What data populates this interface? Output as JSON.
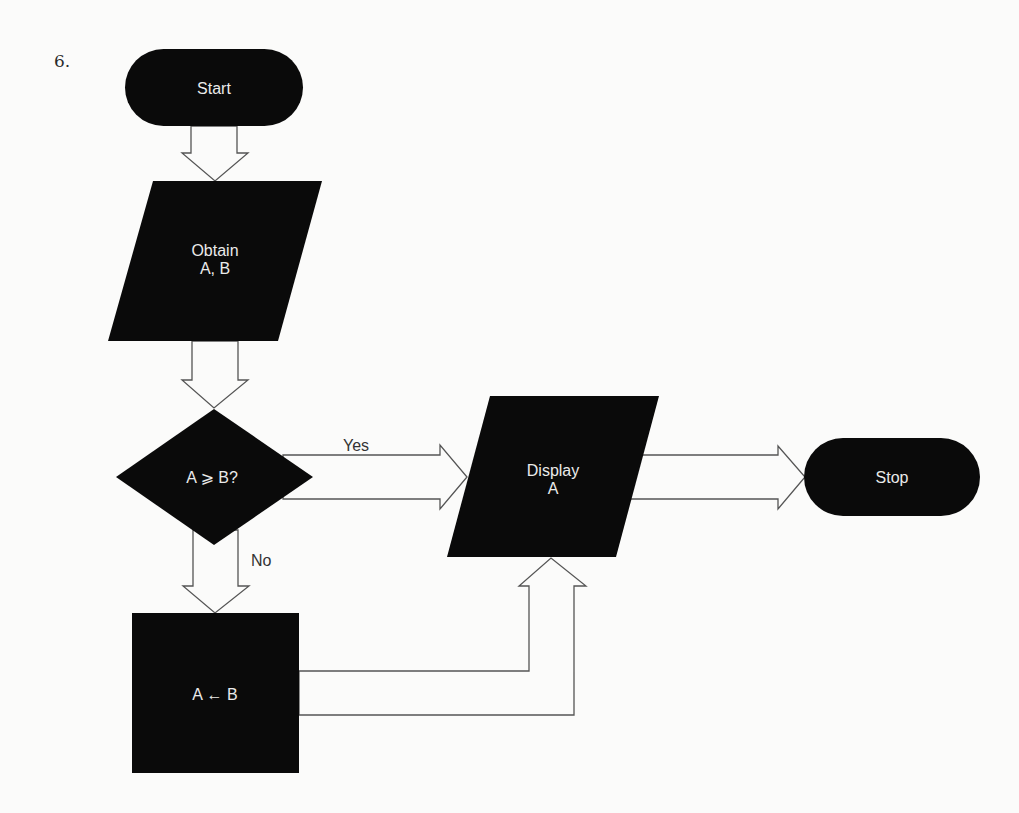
{
  "problem_number": "6.",
  "flowchart": {
    "nodes": {
      "start": {
        "type": "terminal",
        "label": "Start"
      },
      "obtain": {
        "type": "input-output",
        "label": "Obtain",
        "vars": "A, B"
      },
      "decision": {
        "type": "decision",
        "label": "A ⩾ B?"
      },
      "display": {
        "type": "input-output",
        "label": "Display",
        "vars": "A"
      },
      "assign": {
        "type": "process",
        "label": "A ← B"
      },
      "stop": {
        "type": "terminal",
        "label": "Stop"
      }
    },
    "edges": [
      {
        "from": "start",
        "to": "obtain",
        "label": ""
      },
      {
        "from": "obtain",
        "to": "decision",
        "label": ""
      },
      {
        "from": "decision",
        "to": "display",
        "label": "Yes"
      },
      {
        "from": "decision",
        "to": "assign",
        "label": "No"
      },
      {
        "from": "assign",
        "to": "display",
        "label": ""
      },
      {
        "from": "display",
        "to": "stop",
        "label": ""
      }
    ]
  },
  "colors": {
    "shape_fill": "#0a0a0a",
    "shape_text": "#eaeaea",
    "background": "#fbfbfa",
    "arrow_outline": "#555555"
  }
}
